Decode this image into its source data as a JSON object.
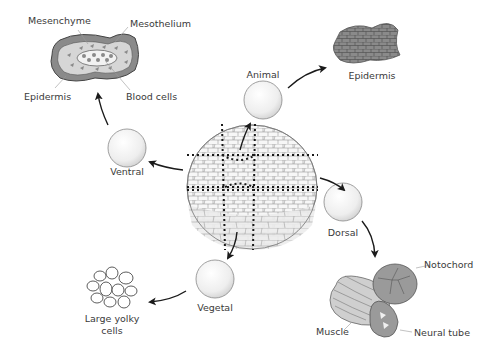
{
  "diagram": {
    "type": "cell-fate-explant-diagram",
    "center": {
      "name": "blastula",
      "description": "Embryo with dotted cut lines dividing it into regions"
    },
    "explants": [
      {
        "label": "Animal",
        "fate": "Epidermis"
      },
      {
        "label": "Ventral",
        "fate": "Mesenchyme / Mesothelium / Epidermis / Blood cells"
      },
      {
        "label": "Dorsal",
        "fate": "Notochord / Muscle / Neural tube"
      },
      {
        "label": "Vegetal",
        "fate": "Large yolky cells"
      }
    ],
    "labels": {
      "mesenchyme": "Mesenchyme",
      "mesothelium": "Mesothelium",
      "epidermis_ventral": "Epidermis",
      "blood_cells": "Blood cells",
      "animal": "Animal",
      "epidermis_animal": "Epidermis",
      "ventral": "Ventral",
      "dorsal": "Dorsal",
      "vegetal": "Vegetal",
      "large_yolky_line1": "Large yolky",
      "large_yolky_line2": "cells",
      "notochord": "Notochord",
      "muscle": "Muscle",
      "neural_tube": "Neural tube"
    },
    "colors": {
      "tissue_dark": "#7a7a7a",
      "tissue_mid": "#a9a9a9",
      "tissue_light": "#d9d9d9",
      "outline": "#555555",
      "arrow": "#1a1a1a",
      "text": "#3a3a3a"
    }
  }
}
